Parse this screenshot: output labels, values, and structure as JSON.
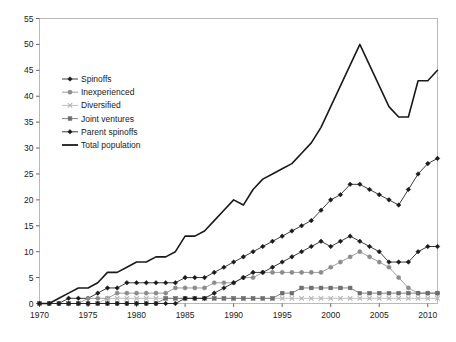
{
  "chart_data": {
    "type": "line",
    "title": "",
    "xlabel": "",
    "ylabel": "",
    "xlim": [
      1970,
      2011
    ],
    "ylim": [
      0,
      55
    ],
    "ytick_step": 5,
    "xtick_step": 5,
    "grid": false,
    "legend_position": "upper-left-inside",
    "ytick_labels": [
      "0",
      "5",
      "10",
      "15",
      "20",
      "25",
      "30",
      "35",
      "40",
      "45",
      "50",
      "55"
    ],
    "xtick_labels": [
      "1970",
      "1975",
      "1980",
      "1985",
      "1990",
      "1995",
      "2000",
      "2005",
      "2010"
    ],
    "x": [
      1970,
      1971,
      1972,
      1973,
      1974,
      1975,
      1976,
      1977,
      1978,
      1979,
      1980,
      1981,
      1982,
      1983,
      1984,
      1985,
      1986,
      1987,
      1988,
      1989,
      1990,
      1991,
      1992,
      1993,
      1994,
      1995,
      1996,
      1997,
      1998,
      1999,
      2000,
      2001,
      2002,
      2003,
      2004,
      2005,
      2006,
      2007,
      2008,
      2009,
      2010,
      2011
    ],
    "series": [
      {
        "name": "Spinoffs",
        "color": "#1a1a1a",
        "marker": "diamond",
        "values": [
          0,
          0,
          0,
          1,
          1,
          1,
          2,
          3,
          3,
          4,
          4,
          4,
          4,
          4,
          4,
          5,
          5,
          5,
          6,
          7,
          8,
          9,
          10,
          11,
          12,
          13,
          14,
          15,
          16,
          18,
          20,
          21,
          23,
          23,
          22,
          21,
          20,
          19,
          22,
          25,
          27,
          28
        ]
      },
      {
        "name": "Inexperienced",
        "color": "#8c8c8c",
        "marker": "circle",
        "values": [
          0,
          0,
          0,
          0,
          0,
          1,
          1,
          1,
          2,
          2,
          2,
          2,
          2,
          2,
          3,
          3,
          3,
          3,
          4,
          4,
          4,
          5,
          5,
          6,
          6,
          6,
          6,
          6,
          6,
          6,
          7,
          8,
          9,
          10,
          9,
          8,
          7,
          5,
          3,
          2,
          2,
          2
        ]
      },
      {
        "name": "Diversified",
        "color": "#b5b5b5",
        "marker": "cross",
        "values": [
          0,
          0,
          0,
          0,
          0,
          0,
          0,
          1,
          1,
          1,
          1,
          1,
          1,
          1,
          1,
          1,
          1,
          1,
          1,
          1,
          1,
          1,
          1,
          1,
          1,
          1,
          1,
          1,
          1,
          1,
          1,
          1,
          1,
          1,
          1,
          1,
          1,
          1,
          1,
          1,
          1,
          1
        ]
      },
      {
        "name": "Joint ventures",
        "color": "#6e6e6e",
        "marker": "square",
        "values": [
          0,
          0,
          0,
          0,
          0,
          0,
          0,
          0,
          0,
          0,
          0,
          0,
          0,
          1,
          1,
          1,
          1,
          1,
          1,
          1,
          1,
          1,
          1,
          1,
          1,
          2,
          2,
          3,
          3,
          3,
          3,
          3,
          3,
          2,
          2,
          2,
          2,
          2,
          2,
          2,
          2,
          2
        ]
      },
      {
        "name": "Parent spinoffs",
        "color": "#1a1a1a",
        "marker": "diamond",
        "values": [
          0,
          0,
          0,
          0,
          0,
          0,
          0,
          0,
          0,
          0,
          0,
          0,
          0,
          0,
          0,
          1,
          1,
          1,
          2,
          3,
          4,
          5,
          6,
          6,
          7,
          8,
          9,
          10,
          11,
          12,
          11,
          12,
          13,
          12,
          11,
          10,
          8,
          8,
          8,
          10,
          11,
          11
        ]
      },
      {
        "name": "Total population",
        "color": "#1a1a1a",
        "marker": "none",
        "values": [
          0,
          0,
          1,
          2,
          3,
          3,
          4,
          6,
          6,
          7,
          8,
          8,
          9,
          9,
          10,
          13,
          13,
          14,
          16,
          18,
          20,
          19,
          22,
          24,
          25,
          26,
          27,
          29,
          31,
          34,
          38,
          42,
          46,
          50,
          46,
          42,
          38,
          36,
          36,
          43,
          43,
          45
        ]
      }
    ]
  }
}
